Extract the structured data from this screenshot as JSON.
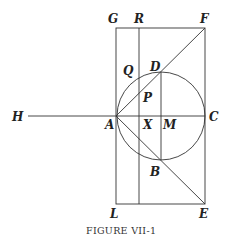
{
  "figure": {
    "caption": "Figure VII-1",
    "caption_display": "FIGURE VII-1",
    "labels": {
      "G": "G",
      "R": "R",
      "F": "F",
      "Q": "Q",
      "D": "D",
      "P": "P",
      "H": "H",
      "A": "A",
      "X": "X",
      "M": "M",
      "C": "C",
      "B": "B",
      "L": "L",
      "E": "E"
    },
    "points": {
      "G": [
        116,
        28
      ],
      "R": [
        139,
        28
      ],
      "F": [
        205,
        28
      ],
      "H": [
        28,
        116
      ],
      "A": [
        116,
        116
      ],
      "X": [
        139,
        116
      ],
      "M": [
        161,
        116
      ],
      "C": [
        205,
        116
      ],
      "D": [
        161,
        72
      ],
      "B": [
        161,
        160
      ],
      "L": [
        116,
        204
      ],
      "E": [
        205,
        204
      ]
    },
    "circle": {
      "center": "M",
      "radius": 44
    },
    "colors": {
      "line": "#333333",
      "text": "#222222",
      "background": "#ffffff"
    }
  }
}
